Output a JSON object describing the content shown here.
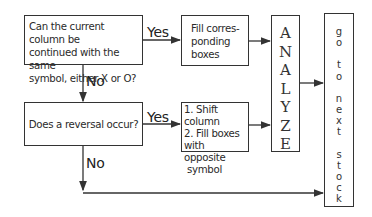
{
  "diagram": {
    "question1": "Can the current column be continued with the same symbol, either X or O?",
    "question1_lines": [
      "Can the current column be",
      "continued with the same",
      "symbol, either X or O?"
    ],
    "fill_box_lines": [
      "Fill corres-",
      "ponding",
      "boxes"
    ],
    "question2": "Does a reversal occur?",
    "shift_box_lines": [
      "1. Shift column",
      "2. Fill boxes",
      "with opposite",
      "symbol"
    ],
    "analyze_letters": [
      "A",
      "N",
      "A",
      "L",
      "Y",
      "Z",
      "E"
    ],
    "next_stock_chars": [
      "g",
      "o",
      "",
      "t",
      "o",
      "",
      "n",
      "e",
      "x",
      "t",
      "",
      "s",
      "t",
      "o",
      "c",
      "k"
    ],
    "edge_labels": {
      "yes1": "Yes",
      "no1": "No",
      "yes2": "Yes",
      "no2": "No"
    },
    "colors": {
      "line": "#333333",
      "text": "#222222",
      "background": "#ffffff"
    }
  }
}
